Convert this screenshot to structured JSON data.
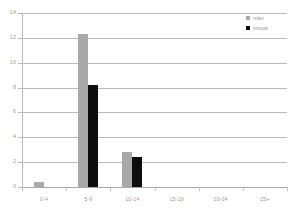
{
  "chart_data": {
    "type": "bar",
    "title": "",
    "xlabel": "",
    "ylabel": "",
    "categories": [
      "0-4",
      "5-9",
      "10-14",
      "15-19",
      "20-24",
      "25+"
    ],
    "series": [
      {
        "name": "man",
        "color": "#a9a9a9",
        "values": [
          0.4,
          12.3,
          2.85,
          0,
          0,
          0
        ]
      },
      {
        "name": "vrouw",
        "color": "#0d0d0d",
        "values": [
          0,
          8.2,
          2.4,
          0,
          0,
          0
        ]
      }
    ],
    "ylim": [
      0,
      14
    ],
    "yticks": [
      0,
      2,
      4,
      6,
      8,
      10,
      12,
      14
    ],
    "ytick_labels": [
      "0",
      "2",
      "4",
      "6",
      "8",
      "10",
      "12",
      "14"
    ],
    "grid": true,
    "legend_position": "top-right"
  },
  "legend": {
    "items": [
      {
        "label": "man",
        "swatch": "legend-swatch-man"
      },
      {
        "label": "vrouw",
        "swatch": "legend-swatch-vrouw"
      }
    ]
  },
  "colors": {
    "man": "#a9a9a9",
    "vrouw": "#0d0d0d",
    "grid": "#b9b9b9",
    "axis_text": "#9a9a9a",
    "background": "#ffffff"
  }
}
